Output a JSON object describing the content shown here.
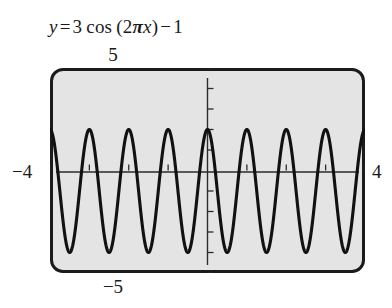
{
  "figure": {
    "kind": "graphing-calculator-screen",
    "equation": {
      "full_text": "y = 3 cos (2πx) − 1",
      "lhs": "y",
      "equals": "=",
      "amplitude": "3",
      "function": "cos",
      "open_paren": "(",
      "coefficient": "2",
      "pi": "π",
      "variable": "x",
      "close_paren": ")",
      "minus": "−",
      "constant": "1"
    },
    "window": {
      "ymax_label": "5",
      "ymin_label": "−5",
      "xmin_label": "−4",
      "xmax_label": "4"
    },
    "colors": {
      "screen_background": "#e4e4e4",
      "frame": "#1b1b1b",
      "curve": "#111111",
      "axis": "#2b2b2b",
      "page_background": "#ffffff",
      "text": "#1a1a1a"
    }
  },
  "chart_data": {
    "type": "line",
    "xlabel": "x",
    "ylabel": "y",
    "xlim": [
      -4,
      4
    ],
    "ylim": [
      -5,
      5
    ],
    "grid": false,
    "legend": null,
    "axis_ticks": {
      "x": [
        -4,
        -3,
        -2,
        -1,
        0,
        1,
        2,
        3,
        4
      ],
      "y": [
        -5,
        -4,
        -3,
        -2,
        -1,
        0,
        1,
        2,
        3,
        4,
        5
      ],
      "x_tick_step": 1,
      "y_tick_step": 1
    },
    "tick_labels_shown": {
      "x": [
        "−4",
        "4"
      ],
      "y": [
        "5",
        "−5"
      ]
    },
    "function": {
      "expression": "3*cos(2*pi*x) - 1",
      "amplitude": 3,
      "period": 1,
      "frequency": 1,
      "vertical_shift": -1,
      "phase_shift": 0,
      "maximum": 2,
      "minimum": -4,
      "midline": -1,
      "cycles_visible": 8
    },
    "series": [
      {
        "name": "y = 3 cos (2πx) − 1",
        "maxima_x": [
          -4,
          -3,
          -2,
          -1,
          0,
          1,
          2,
          3,
          4
        ],
        "maxima_y": 2,
        "minima_x": [
          -3.5,
          -2.5,
          -1.5,
          -0.5,
          0.5,
          1.5,
          2.5,
          3.5
        ],
        "minima_y": -4
      }
    ]
  }
}
